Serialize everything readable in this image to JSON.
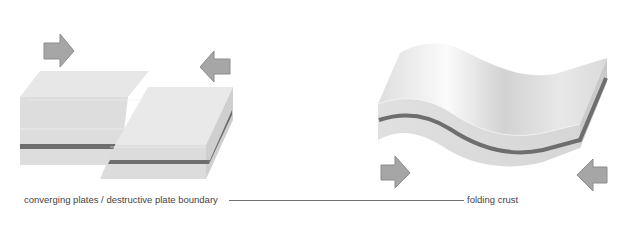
{
  "diagram": {
    "panels": [
      {
        "id": "converging",
        "caption": "converging plates / destructive plate boundary",
        "arrows": [
          {
            "direction": "right",
            "x": 44,
            "y": 33
          },
          {
            "direction": "left",
            "x": 200,
            "y": 50
          }
        ]
      },
      {
        "id": "folding",
        "caption": "folding crust",
        "arrows": [
          {
            "direction": "right",
            "x": 380,
            "y": 156
          },
          {
            "direction": "left",
            "x": 576,
            "y": 159
          }
        ]
      }
    ],
    "leader_line": {
      "from": "converging plates / destructive plate boundary",
      "to": "folding crust"
    },
    "colors": {
      "background": "#ffffff",
      "plate_top": "#e6e6e6",
      "plate_side": "#dcdcdc",
      "plate_edge": "#c8c8c8",
      "stripe": "#6e6e6e",
      "arrow_fill": "#a6a6a6",
      "arrow_stroke": "#8c8c8c",
      "caption_text": "#444444",
      "leader": "#6f6f6f"
    }
  }
}
